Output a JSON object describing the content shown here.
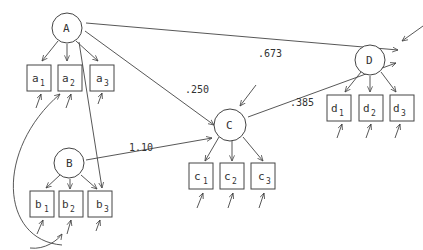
{
  "diagram": {
    "type": "path-diagram",
    "latent_nodes": [
      {
        "id": "A",
        "label": "A",
        "indicators": [
          {
            "base": "a",
            "sub": "1"
          },
          {
            "base": "a",
            "sub": "2"
          },
          {
            "base": "a",
            "sub": "3"
          }
        ]
      },
      {
        "id": "B",
        "label": "B",
        "indicators": [
          {
            "base": "b",
            "sub": "1"
          },
          {
            "base": "b",
            "sub": "2"
          },
          {
            "base": "b",
            "sub": "3"
          }
        ]
      },
      {
        "id": "C",
        "label": "C",
        "indicators": [
          {
            "base": "c",
            "sub": "1"
          },
          {
            "base": "c",
            "sub": "2"
          },
          {
            "base": "c",
            "sub": "3"
          }
        ]
      },
      {
        "id": "D",
        "label": "D",
        "indicators": [
          {
            "base": "d",
            "sub": "1"
          },
          {
            "base": "d",
            "sub": "2"
          },
          {
            "base": "d",
            "sub": "3"
          }
        ]
      }
    ],
    "paths": [
      {
        "from": "A",
        "to": "D",
        "coef": ".673"
      },
      {
        "from": "A",
        "to": "C",
        "coef": ".250"
      },
      {
        "from": "B",
        "to": "C",
        "coef": "1.10"
      },
      {
        "from": "C",
        "to": "D",
        "coef": ".385"
      },
      {
        "from": "A",
        "to": "b3",
        "coef": ""
      },
      {
        "from": "b2",
        "to": "a2",
        "coef": "",
        "curved": true
      }
    ]
  }
}
